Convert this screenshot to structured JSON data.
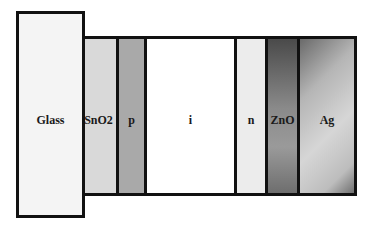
{
  "diagram": {
    "substrate": {
      "label": "Glass",
      "color": "#f4f4f4"
    },
    "layers": [
      {
        "label": "SnO2",
        "color": "#d9d9d9",
        "width": 38
      },
      {
        "label": "p",
        "color": "#a8a8a8",
        "width": 28
      },
      {
        "label": "i",
        "color": "#ffffff",
        "width": 90
      },
      {
        "label": "n",
        "color": "#ececec",
        "width": 31
      },
      {
        "label": "ZnO",
        "color": "#7a7a7a",
        "width": 32
      },
      {
        "label": "Ag",
        "color": "#b0b0b0",
        "width": 54
      }
    ]
  }
}
